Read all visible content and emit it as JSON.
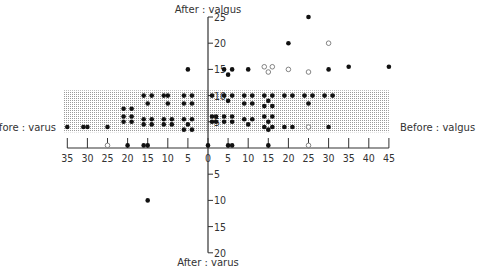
{
  "chart_data": {
    "type": "scatter",
    "title": "",
    "x_axis": {
      "label_positive": "Before : valgus",
      "label_negative": "Before : varus",
      "range": [
        -35,
        45
      ],
      "ticks": [
        -35,
        -30,
        -25,
        -20,
        -15,
        -10,
        -5,
        0,
        5,
        10,
        15,
        20,
        25,
        30,
        35,
        40,
        45
      ],
      "tick_labels": [
        "35",
        "30",
        "25",
        "20",
        "15",
        "10",
        "5",
        "0",
        "5",
        "10",
        "15",
        "20",
        "25",
        "30",
        "35",
        "40",
        "45"
      ]
    },
    "y_axis": {
      "label_positive": "After : valgus",
      "label_negative": "After : varus",
      "range": [
        -20,
        25
      ],
      "ticks": [
        25,
        20,
        15,
        10,
        5,
        -5,
        -10,
        -15,
        -20
      ],
      "tick_labels": [
        "25",
        "20",
        "15",
        "10",
        "5",
        "5",
        "10",
        "15",
        "20"
      ]
    },
    "shaded_band": {
      "y_from": 3,
      "y_to": 11,
      "x_from": -35,
      "x_to": 45,
      "label": "target range"
    },
    "grid": false,
    "legend": null,
    "series": [
      {
        "name": "filled",
        "marker": "filled-circle",
        "points": [
          [
            -35,
            4
          ],
          [
            -31,
            4
          ],
          [
            -30,
            4
          ],
          [
            -25,
            4
          ],
          [
            -21,
            6
          ],
          [
            -19,
            6
          ],
          [
            -21,
            7.5
          ],
          [
            -19,
            7.5
          ],
          [
            -21,
            5
          ],
          [
            -19,
            5
          ],
          [
            -16,
            10
          ],
          [
            -14,
            10
          ],
          [
            -15,
            8.5
          ],
          [
            -16,
            5.5
          ],
          [
            -14,
            5.5
          ],
          [
            -16,
            4.5
          ],
          [
            -14,
            4.5
          ],
          [
            -11,
            10
          ],
          [
            -10,
            10
          ],
          [
            -10,
            8.5
          ],
          [
            -11,
            5.5
          ],
          [
            -9,
            5.5
          ],
          [
            -11,
            4.5
          ],
          [
            -9,
            4.5
          ],
          [
            -6,
            10
          ],
          [
            -4,
            10
          ],
          [
            -6,
            8.5
          ],
          [
            -4,
            8.5
          ],
          [
            -6,
            5.5
          ],
          [
            -4,
            5.5
          ],
          [
            -5,
            4.5
          ],
          [
            -6,
            3.5
          ],
          [
            -4,
            3.5
          ],
          [
            -5,
            15
          ],
          [
            -15,
            -10
          ],
          [
            1,
            10
          ],
          [
            1,
            6
          ],
          [
            1,
            5
          ],
          [
            2,
            6
          ],
          [
            2,
            5
          ],
          [
            4,
            15
          ],
          [
            6,
            15
          ],
          [
            5,
            14
          ],
          [
            4,
            10
          ],
          [
            6,
            10
          ],
          [
            5,
            9
          ],
          [
            4,
            6
          ],
          [
            6,
            6
          ],
          [
            4,
            5
          ],
          [
            6,
            5
          ],
          [
            10,
            15
          ],
          [
            9,
            10
          ],
          [
            11,
            10
          ],
          [
            9,
            8.5
          ],
          [
            11,
            8.5
          ],
          [
            9,
            5.5
          ],
          [
            11,
            5.5
          ],
          [
            10,
            4.5
          ],
          [
            14,
            10
          ],
          [
            16,
            10
          ],
          [
            15,
            9
          ],
          [
            14,
            8
          ],
          [
            16,
            8
          ],
          [
            14,
            6
          ],
          [
            16,
            6
          ],
          [
            15,
            5
          ],
          [
            14,
            4
          ],
          [
            16,
            4
          ],
          [
            15,
            3.5
          ],
          [
            20,
            20
          ],
          [
            19,
            10
          ],
          [
            21,
            10
          ],
          [
            19,
            4
          ],
          [
            21,
            4
          ],
          [
            25,
            25
          ],
          [
            24,
            10
          ],
          [
            26,
            10
          ],
          [
            25,
            8.5
          ],
          [
            30,
            15
          ],
          [
            29,
            10
          ],
          [
            31,
            10
          ],
          [
            30,
            4
          ],
          [
            35,
            15.5
          ],
          [
            45,
            15.5
          ],
          [
            5,
            0.5
          ],
          [
            6,
            0.5
          ],
          [
            15,
            0.5
          ],
          [
            -15,
            0.5
          ],
          [
            -16,
            0.5
          ],
          [
            -20,
            0.5
          ],
          [
            0,
            0.5
          ]
        ]
      },
      {
        "name": "open",
        "marker": "open-circle",
        "points": [
          [
            14,
            15.5
          ],
          [
            16,
            15.5
          ],
          [
            15,
            14.5
          ],
          [
            20,
            15
          ],
          [
            25,
            14.5
          ],
          [
            30,
            20
          ],
          [
            25,
            4
          ],
          [
            -25,
            0.5
          ],
          [
            25,
            0.5
          ]
        ]
      }
    ]
  }
}
